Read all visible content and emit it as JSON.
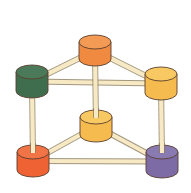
{
  "diagram": {
    "type": "molecular-prism-model",
    "colors": {
      "rod_fill": "#f6e9c4",
      "rod_stroke": "#7a6a4a",
      "outline": "#5a4030"
    },
    "nodes": [
      {
        "id": "top-orange",
        "cx": 95,
        "cy": 42,
        "rx": 16,
        "ry": 7,
        "h": 17,
        "fill": "#f08a40",
        "top": "#f39a55"
      },
      {
        "id": "left-green",
        "cx": 32,
        "cy": 72,
        "rx": 16,
        "ry": 7,
        "h": 19,
        "fill": "#3f6e4f",
        "top": "#4a7a59"
      },
      {
        "id": "right-yellow",
        "cx": 161,
        "cy": 74,
        "rx": 16,
        "ry": 7,
        "h": 19,
        "fill": "#f6bb4e",
        "top": "#f8c962"
      },
      {
        "id": "middle-yellow",
        "cx": 96,
        "cy": 117,
        "rx": 16,
        "ry": 7,
        "h": 18,
        "fill": "#f6bb4e",
        "top": "#f8c962"
      },
      {
        "id": "bottom-left-red",
        "cx": 33,
        "cy": 152,
        "rx": 16,
        "ry": 7,
        "h": 18,
        "fill": "#ee6234",
        "top": "#f07445"
      },
      {
        "id": "bottom-right-purple",
        "cx": 162,
        "cy": 152,
        "rx": 16,
        "ry": 7,
        "h": 19,
        "fill": "#7d6ba6",
        "top": "#8a7ab2"
      }
    ],
    "edges": [
      {
        "from": "top-orange",
        "to": "left-green"
      },
      {
        "from": "top-orange",
        "to": "right-yellow"
      },
      {
        "from": "left-green",
        "to": "right-yellow"
      },
      {
        "from": "top-orange",
        "to": "middle-yellow"
      },
      {
        "from": "left-green",
        "to": "bottom-left-red"
      },
      {
        "from": "right-yellow",
        "to": "bottom-right-purple"
      },
      {
        "from": "middle-yellow",
        "to": "bottom-left-red"
      },
      {
        "from": "middle-yellow",
        "to": "bottom-right-purple"
      },
      {
        "from": "bottom-left-red",
        "to": "bottom-right-purple"
      }
    ]
  }
}
